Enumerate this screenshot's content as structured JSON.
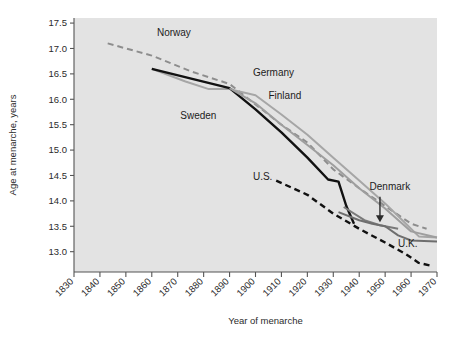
{
  "chart_data": {
    "type": "line",
    "title": "",
    "xlabel": "Year of menarche",
    "ylabel": "Age at menarche, years",
    "xlim": [
      1830,
      1970
    ],
    "ylim": [
      12.6,
      17.6
    ],
    "yticks": [
      "17.5",
      "17.0",
      "16.5",
      "16.0",
      "15.5",
      "15.0",
      "14.5",
      "14.0",
      "13.5",
      "13.0"
    ],
    "ytick_values": [
      17.5,
      17.0,
      16.5,
      16.0,
      15.5,
      15.0,
      14.5,
      14.0,
      13.5,
      13.0
    ],
    "xticks": [
      "1830",
      "1840",
      "1850",
      "1860",
      "1870",
      "1880",
      "1890",
      "1900",
      "1910",
      "1920",
      "1930",
      "1940",
      "1950",
      "1960",
      "1970"
    ],
    "xtick_values": [
      1830,
      1840,
      1850,
      1860,
      1870,
      1880,
      1890,
      1900,
      1910,
      1920,
      1930,
      1940,
      1950,
      1960,
      1970
    ],
    "grid": false,
    "legend": "inline-labels",
    "plot_background": "#e3e3e3",
    "series": [
      {
        "name": "Norway",
        "style": "dashed",
        "color": "#8d8d8d",
        "label_x": 1862,
        "label_y": 17.25,
        "points": [
          [
            1843,
            17.1
          ],
          [
            1860,
            16.86
          ],
          [
            1875,
            16.55
          ],
          [
            1890,
            16.3
          ],
          [
            1900,
            15.9
          ],
          [
            1910,
            15.5
          ],
          [
            1920,
            15.15
          ],
          [
            1930,
            14.62
          ],
          [
            1940,
            14.25
          ],
          [
            1950,
            13.9
          ],
          [
            1960,
            13.55
          ],
          [
            1966,
            13.45
          ]
        ]
      },
      {
        "name": "Sweden",
        "style": "solid",
        "color": "#a6a6a6",
        "label_x": 1871,
        "label_y": 15.62,
        "points": [
          [
            1860,
            16.6
          ],
          [
            1873,
            16.35
          ],
          [
            1882,
            16.2
          ],
          [
            1890,
            16.2
          ],
          [
            1900,
            16.08
          ],
          [
            1910,
            15.7
          ],
          [
            1920,
            15.3
          ],
          [
            1930,
            14.85
          ],
          [
            1940,
            14.4
          ],
          [
            1950,
            13.95
          ],
          [
            1958,
            13.55
          ],
          [
            1963,
            13.3
          ],
          [
            1970,
            13.28
          ]
        ]
      },
      {
        "name": "Germany",
        "style": "solid",
        "color": "#111111",
        "label_x": 1899,
        "label_y": 16.45,
        "points": [
          [
            1860,
            16.6
          ],
          [
            1890,
            16.22
          ],
          [
            1900,
            15.8
          ],
          [
            1910,
            15.35
          ],
          [
            1920,
            14.85
          ],
          [
            1928,
            14.42
          ],
          [
            1932,
            14.38
          ],
          [
            1935,
            13.9
          ],
          [
            1938,
            13.55
          ]
        ]
      },
      {
        "name": "Finland",
        "style": "solid",
        "color": "#9e9e9e",
        "label_x": 1905,
        "label_y": 16.0,
        "points": [
          [
            1890,
            16.22
          ],
          [
            1900,
            15.92
          ],
          [
            1910,
            15.5
          ],
          [
            1920,
            15.1
          ],
          [
            1930,
            14.7
          ],
          [
            1940,
            14.25
          ],
          [
            1950,
            13.85
          ],
          [
            1960,
            13.4
          ],
          [
            1970,
            13.28
          ]
        ]
      },
      {
        "name": "U.S.",
        "style": "dashed",
        "color": "#111111",
        "label_x": 1899,
        "label_y": 14.42,
        "points": [
          [
            1908,
            14.4
          ],
          [
            1920,
            14.12
          ],
          [
            1930,
            13.75
          ],
          [
            1940,
            13.45
          ],
          [
            1950,
            13.18
          ],
          [
            1958,
            12.95
          ],
          [
            1963,
            12.78
          ],
          [
            1968,
            12.72
          ]
        ]
      },
      {
        "name": "Denmark",
        "style": "solid",
        "color": "#7a7a7a",
        "label_x": 1944,
        "label_y": 14.22,
        "points": [
          [
            1934,
            13.88
          ],
          [
            1942,
            13.62
          ],
          [
            1948,
            13.52
          ],
          [
            1955,
            13.45
          ]
        ]
      },
      {
        "name": "U.K.",
        "style": "solid",
        "color": "#6e6e6e",
        "label_x": 1955,
        "label_y": 13.1,
        "points": [
          [
            1932,
            13.78
          ],
          [
            1940,
            13.62
          ],
          [
            1945,
            13.55
          ],
          [
            1950,
            13.5
          ],
          [
            1955,
            13.32
          ],
          [
            1960,
            13.22
          ],
          [
            1970,
            13.2
          ]
        ]
      }
    ],
    "annotations": [
      {
        "name": "denmark-arrow",
        "from_x": 1948,
        "from_y": 14.08,
        "to_x": 1948,
        "to_y": 13.62
      }
    ]
  }
}
